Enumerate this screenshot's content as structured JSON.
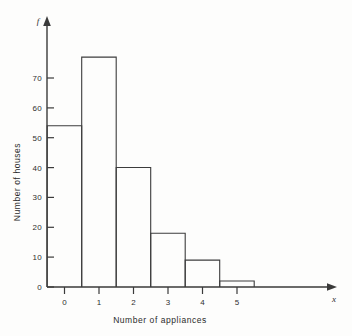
{
  "figure": {
    "background_color": "#fdfdfc",
    "ink_color": "#3a3a3a"
  },
  "chart_data": {
    "type": "bar",
    "title": "",
    "subtitle": "",
    "xlabel": "Number of appliances",
    "ylabel": "Number of houses",
    "x_variable_symbol": "x",
    "y_variable_symbol": "f",
    "categories": [
      "0",
      "1",
      "2",
      "3",
      "4",
      "5"
    ],
    "values": [
      54,
      77,
      40,
      18,
      9,
      2
    ],
    "xlim": [
      -0.5,
      5.5
    ],
    "ylim": [
      0,
      80
    ],
    "y_ticks": [
      0,
      10,
      20,
      30,
      40,
      50,
      60,
      70
    ],
    "y_tick_labels": [
      "0",
      "10",
      "20",
      "30",
      "40",
      "50",
      "60",
      "70"
    ],
    "x_ticks": [
      0,
      1,
      2,
      3,
      4,
      5
    ],
    "x_tick_labels": [
      "0",
      "1",
      "2",
      "3",
      "4",
      "5"
    ],
    "grid": false,
    "legend": false,
    "legend_position": "none",
    "bar_style": "outline",
    "axis_arrows": true,
    "annotations": []
  }
}
